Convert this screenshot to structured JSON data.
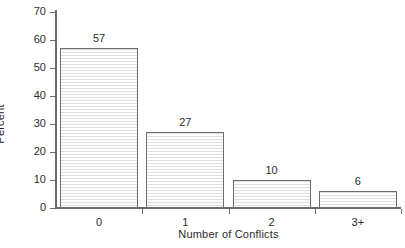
{
  "chart_data": {
    "type": "bar",
    "title": "",
    "subtitle": "",
    "xlabel": "Number of Conflicts",
    "ylabel": "Percent",
    "categories": [
      "0",
      "1",
      "2",
      "3+"
    ],
    "values": [
      57,
      27,
      10,
      6
    ],
    "data_labels": [
      "57",
      "27",
      "10",
      "6"
    ],
    "ylim": [
      0,
      70
    ],
    "ytick_values": [
      0,
      10,
      20,
      30,
      40,
      50,
      60,
      70
    ],
    "ytick_labels": [
      "0",
      "10",
      "20",
      "30",
      "40",
      "50",
      "60",
      "70"
    ],
    "grid": false,
    "legend": false,
    "legend_position": "none",
    "bar_fill": "#fdfdfd",
    "bar_hatch_color": "#dedede",
    "bar_edge_color": "#6e6e6e",
    "axis_color": "#6b6b6b",
    "text_color": "#2b2b2b",
    "background": "#ffffff"
  }
}
